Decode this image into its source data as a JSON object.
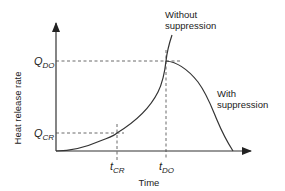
{
  "diagram": {
    "type": "line",
    "title": "",
    "xlabel": "Time",
    "ylabel": "Heat release rate",
    "y_markers": [
      {
        "main": "Q",
        "sub": "DO"
      },
      {
        "main": "Q",
        "sub": "CR"
      }
    ],
    "x_markers": [
      {
        "main": "t",
        "sub": "CR"
      },
      {
        "main": "t",
        "sub": "DO"
      }
    ],
    "annotations": {
      "without_line1": "Without",
      "without_line2": "suppression",
      "with_line1": "With",
      "with_line2": "suppression"
    },
    "colors": {
      "line": "#333333",
      "axis": "#333333",
      "text": "#222222"
    }
  }
}
